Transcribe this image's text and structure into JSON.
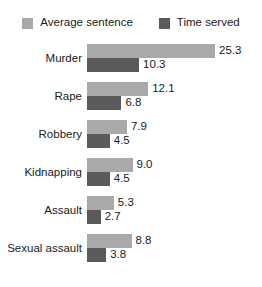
{
  "legend": {
    "entries": [
      {
        "label": "Average sentence",
        "color": "#a9a9a9",
        "swatch_name": "legend-swatch-average-sentence"
      },
      {
        "label": "Time served",
        "color": "#5a5a5a",
        "swatch_name": "legend-swatch-time-served"
      }
    ]
  },
  "chart_data": {
    "type": "bar",
    "orientation": "horizontal",
    "title": "",
    "subtitle": "",
    "xlabel": "",
    "ylabel": "",
    "grid": false,
    "legend_position": "top-center",
    "xlim": [
      0,
      25.3
    ],
    "categories": [
      "Murder",
      "Rape",
      "Robbery",
      "Kidnapping",
      "Assault",
      "Sexual assault"
    ],
    "series": [
      {
        "name": "Average sentence",
        "color": "#a9a9a9",
        "values": [
          25.3,
          12.1,
          7.9,
          9.0,
          5.3,
          8.8
        ],
        "labels": [
          "25.3",
          "12.1",
          "7.9",
          "9.0",
          "5.3",
          "8.8"
        ]
      },
      {
        "name": "Time served",
        "color": "#5a5a5a",
        "values": [
          10.3,
          6.8,
          4.5,
          4.5,
          2.7,
          3.8
        ],
        "labels": [
          "10.3",
          "6.8",
          "4.5",
          "4.5",
          "2.7",
          "3.8"
        ]
      }
    ]
  },
  "scale": {
    "px_per_unit": 5.06,
    "bar_origin_x": 87,
    "group_pitch": 38,
    "bar_height": 14
  }
}
